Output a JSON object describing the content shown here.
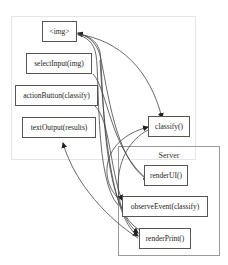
{
  "clusters": {
    "server": {
      "label": "Server"
    }
  },
  "nodes": {
    "img": "<img>",
    "select_input": "selectInput(img)",
    "action_button": "actionButton(classify)",
    "text_output": "textOutput(results)",
    "classify": "classify()",
    "render_ui": "renderUI()",
    "observe_event": "observeEvent(classify)",
    "render_print": "renderPrint()"
  },
  "edges": [
    {
      "from": "renderUI()",
      "to": "<img>"
    },
    {
      "from": "selectInput(img)",
      "to": "renderUI()"
    },
    {
      "from": "actionButton(classify)",
      "to": "observeEvent(classify)"
    },
    {
      "from": "<img>",
      "to": "classify()"
    },
    {
      "from": "observeEvent(classify)",
      "to": "classify()"
    },
    {
      "from": "classify()",
      "to": "renderPrint()"
    },
    {
      "from": "renderPrint()",
      "to": "textOutput(results)"
    },
    {
      "from": "<img>",
      "to": "observeEvent(classify)"
    },
    {
      "from": "<img>",
      "to": "renderPrint()"
    }
  ],
  "colors": {
    "edge": "#333333",
    "node_border": "#555555",
    "ui_cluster_border": "#e6e6e6",
    "server_cluster_border": "#9a9a9a"
  }
}
